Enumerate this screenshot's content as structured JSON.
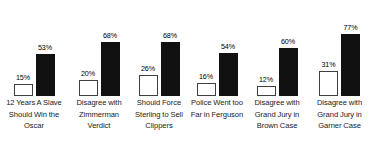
{
  "chart_data": {
    "type": "bar",
    "title": "",
    "subtitle": "",
    "xlabel": "",
    "ylabel": "",
    "ylim": [
      0,
      100
    ],
    "grid": false,
    "legend": "none",
    "value_suffix": "%",
    "categories": [
      "12 Years A Slave Should Win the Oscar",
      "Disagree with Zimmerman Verdict",
      "Should Force Sterling to Sell Clippers",
      "Police Went too Far in Ferguson",
      "Disagree with Grand Jury in Brown Case",
      "Disagree with Grand Jury in Garner Case"
    ],
    "series": [
      {
        "name": "series-a",
        "color": "#ffffff",
        "border_color": "#3f3f3f",
        "values": [
          15,
          20,
          26,
          16,
          12,
          31
        ],
        "labels": [
          "15%",
          "20%",
          "26%",
          "16%",
          "12%",
          "31%"
        ]
      },
      {
        "name": "series-b",
        "color": "#111111",
        "border_color": "#111111",
        "values": [
          53,
          68,
          68,
          54,
          60,
          77
        ],
        "labels": [
          "53%",
          "68%",
          "68%",
          "54%",
          "60%",
          "77%"
        ]
      }
    ],
    "groups": [
      {
        "label": "12 Years A Slave Should Win the Oscar",
        "label_lines": [
          "12 Years A Slave",
          "Should Win the",
          "Oscar"
        ],
        "bars": [
          {
            "series": "series-a",
            "value": 15,
            "label": "15%"
          },
          {
            "series": "series-b",
            "value": 53,
            "label": "53%"
          }
        ]
      },
      {
        "label": "Disagree with Zimmerman Verdict",
        "label_lines": [
          "Disagree with",
          "Zimmerman",
          "Verdict"
        ],
        "bars": [
          {
            "series": "series-a",
            "value": 20,
            "label": "20%"
          },
          {
            "series": "series-b",
            "value": 68,
            "label": "68%"
          }
        ]
      },
      {
        "label": "Should Force Sterling to Sell Clippers",
        "label_lines": [
          "Should Force",
          "Sterling to Sell",
          "Clippers"
        ],
        "bars": [
          {
            "series": "series-a",
            "value": 26,
            "label": "26%"
          },
          {
            "series": "series-b",
            "value": 68,
            "label": "68%"
          }
        ]
      },
      {
        "label": "Police Went too Far in Ferguson",
        "label_lines": [
          "Police Went too",
          "Far in Ferguson"
        ],
        "bars": [
          {
            "series": "series-a",
            "value": 16,
            "label": "16%"
          },
          {
            "series": "series-b",
            "value": 54,
            "label": "54%"
          }
        ]
      },
      {
        "label": "Disagree with Grand Jury in Brown Case",
        "label_lines": [
          "Disagree with",
          "Grand Jury in",
          "Brown Case"
        ],
        "bars": [
          {
            "series": "series-a",
            "value": 12,
            "label": "12%"
          },
          {
            "series": "series-b",
            "value": 60,
            "label": "60%"
          }
        ]
      },
      {
        "label": "Disagree with Grand Jury in Garner Case",
        "label_lines": [
          "Disagree with",
          "Grand Jury in",
          "Garner Case"
        ],
        "bars": [
          {
            "series": "series-a",
            "value": 31,
            "label": "31%"
          },
          {
            "series": "series-b",
            "value": 77,
            "label": "77%"
          }
        ]
      }
    ]
  },
  "layout": {
    "group_widths_px": [
      68,
      62,
      58,
      58,
      62,
      63
    ],
    "plot_height_px": 96,
    "baseline_y_px": 95,
    "max_bar_height_px": 80,
    "bar_width_px": 19,
    "background": "#ffffff"
  }
}
